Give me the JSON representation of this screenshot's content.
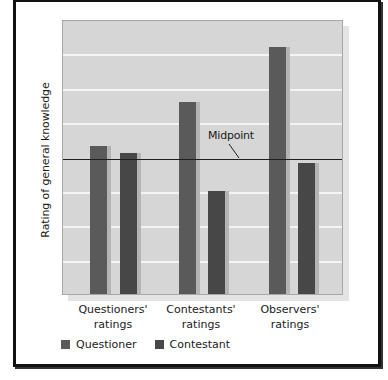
{
  "chart_data": {
    "type": "bar",
    "title": "",
    "xlabel": "",
    "ylabel": "Rating of general knowledge",
    "categories": [
      "Questioners' ratings",
      "Contestants' ratings",
      "Observers' ratings"
    ],
    "category_lines": [
      [
        "Questioners'",
        "ratings"
      ],
      [
        "Contestants'",
        "ratings"
      ],
      [
        "Observers'",
        "ratings"
      ]
    ],
    "series": [
      {
        "name": "Questioner",
        "color": "#5a5a5a",
        "values": [
          4.3,
          5.6,
          7.2
        ]
      },
      {
        "name": "Contestant",
        "color": "#474747",
        "values": [
          4.1,
          3.0,
          3.8
        ]
      }
    ],
    "ylim": [
      0,
      8
    ],
    "yticks_labeled": false,
    "gridlines": [
      1,
      2,
      3,
      5,
      6,
      7
    ],
    "grid": true,
    "reference_line": {
      "label": "Midpoint",
      "value": 4
    },
    "legend_position": "bottom-left"
  },
  "colors": {
    "plot_background": "#d6d6d6",
    "gridline": "#f4f4f4",
    "bar_shadow": "#b4b4b4",
    "frame": "#111111"
  }
}
